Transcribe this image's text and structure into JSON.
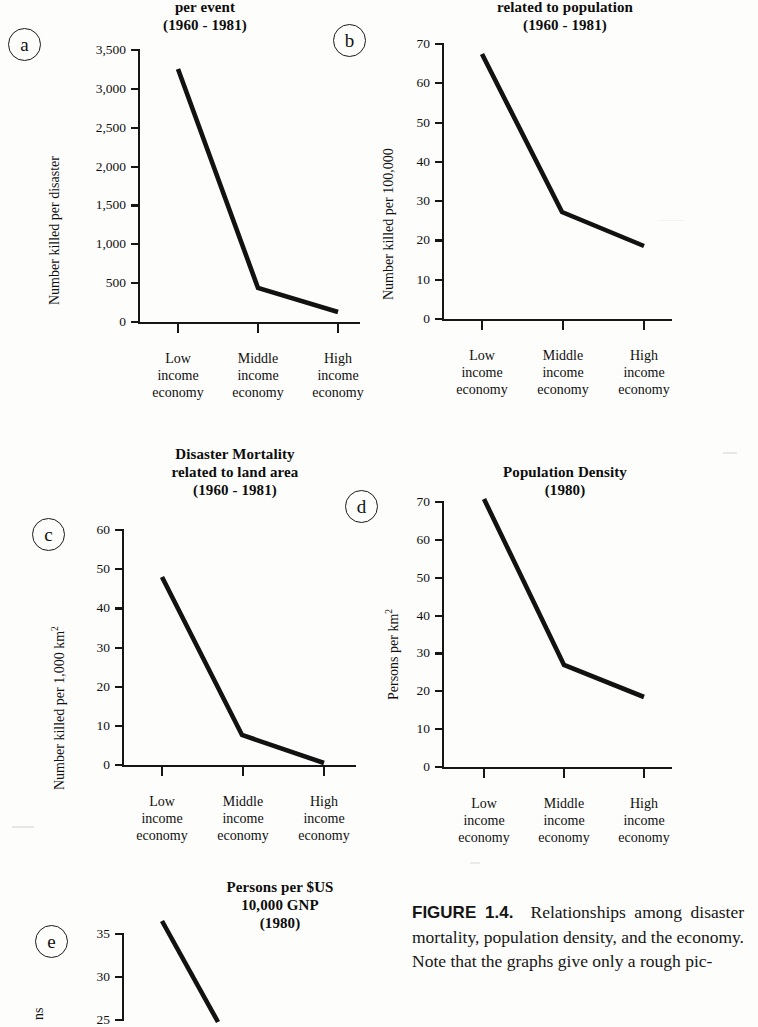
{
  "figure": {
    "caption_label": "FIGURE 1.4.",
    "caption_text": "Relationships among disaster mortality, population density, and the economy. Note that the graphs give only a rough pic-"
  },
  "categories": [
    "Low\nincome\neconomy",
    "Middle\nincome\neconomy",
    "High\nincome\neconomy"
  ],
  "panels": {
    "a": {
      "tag": "a",
      "title": "Disaster Mortality\nper event\n(1960 - 1981)",
      "ylabel": "Number killed per disaster",
      "yticks": [
        "0",
        "500",
        "1,000",
        "1,500",
        "2,000",
        "2,500",
        "3,000",
        "3,500"
      ]
    },
    "b": {
      "tag": "b",
      "title": "Disaster Mortality\nrelated to population\n(1960 - 1981)",
      "ylabel": "Number killed per 100,000",
      "yticks": [
        "0",
        "10",
        "20",
        "30",
        "40",
        "50",
        "60",
        "70"
      ]
    },
    "c": {
      "tag": "c",
      "title": "Disaster Mortality\nrelated to land area\n(1960 - 1981)",
      "ylabel_pre": "Number killed per 1,000 km",
      "ylabel_sup": "2",
      "yticks": [
        "0",
        "10",
        "20",
        "30",
        "40",
        "50",
        "60"
      ]
    },
    "d": {
      "tag": "d",
      "title": "Population Density\n(1980)",
      "ylabel_pre": "Persons per km",
      "ylabel_sup": "2",
      "yticks": [
        "0",
        "10",
        "20",
        "30",
        "40",
        "50",
        "60",
        "70"
      ]
    },
    "e": {
      "tag": "e",
      "title": "Persons per $US\n10,000 GNP\n(1980)",
      "ylabel_partial": "ns",
      "yticks": [
        "25",
        "30",
        "35"
      ]
    }
  },
  "chart_data": [
    {
      "id": "a",
      "type": "line",
      "title": "Disaster Mortality per event (1960 - 1981)",
      "xlabel": "",
      "ylabel": "Number killed per disaster",
      "categories": [
        "Low income economy",
        "Middle income economy",
        "High income economy"
      ],
      "values": [
        3240,
        430,
        130
      ],
      "ylim": [
        0,
        3500
      ],
      "yticks": [
        0,
        500,
        1000,
        1500,
        2000,
        2500,
        3000,
        3500
      ],
      "grid": false,
      "legend": "none"
    },
    {
      "id": "b",
      "type": "line",
      "title": "Disaster Mortality related to population (1960 - 1981)",
      "xlabel": "",
      "ylabel": "Number killed per 100,000",
      "categories": [
        "Low income economy",
        "Middle income economy",
        "High income economy"
      ],
      "values": [
        67.5,
        27,
        18.5
      ],
      "ylim": [
        0,
        70
      ],
      "yticks": [
        0,
        10,
        20,
        30,
        40,
        50,
        60,
        70
      ],
      "grid": false,
      "legend": "none"
    },
    {
      "id": "c",
      "type": "line",
      "title": "Disaster Mortality related to land area (1960 - 1981)",
      "xlabel": "",
      "ylabel": "Number killed per 1,000 km2",
      "categories": [
        "Low income economy",
        "Middle income economy",
        "High income economy"
      ],
      "values": [
        48,
        7.5,
        0.5
      ],
      "ylim": [
        0,
        60
      ],
      "yticks": [
        0,
        10,
        20,
        30,
        40,
        50,
        60
      ],
      "grid": false,
      "legend": "none"
    },
    {
      "id": "d",
      "type": "line",
      "title": "Population Density (1980)",
      "xlabel": "",
      "ylabel": "Persons per km2",
      "categories": [
        "Low income economy",
        "Middle income economy",
        "High income economy"
      ],
      "values": [
        71,
        26.5,
        19
      ],
      "ylim": [
        0,
        70
      ],
      "yticks": [
        0,
        10,
        20,
        30,
        40,
        50,
        60,
        70
      ],
      "grid": false,
      "legend": "none"
    },
    {
      "id": "e",
      "type": "line",
      "title": "Persons per $US 10,000 GNP (1980)",
      "xlabel": "",
      "ylabel": "Persons",
      "categories": [
        "Low income economy",
        "Middle income economy",
        "High income economy"
      ],
      "values": [
        null,
        null,
        null
      ],
      "ylim": [
        25,
        35
      ],
      "yticks": [
        25,
        30,
        35
      ],
      "grid": false,
      "legend": "none",
      "note": "panel cropped at bottom edge of page; only upper portion of first descending segment visible"
    }
  ]
}
